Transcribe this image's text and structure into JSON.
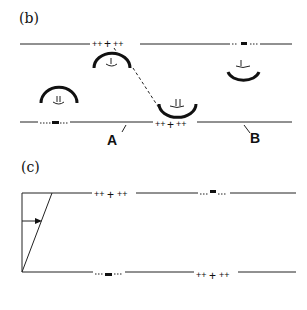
{
  "panel_b": {
    "label": "(b)",
    "top_plus": "++++++",
    "top_minus": "--▬--",
    "bottom_minus": "--▬--",
    "bottom_plus": "+++++",
    "marker_a": "A",
    "marker_b": "B"
  },
  "panel_c": {
    "label": "(c)",
    "top_plus": "++++",
    "top_minus": "--▬--",
    "bottom_minus": "--▬--",
    "bottom_plus": "+++++"
  }
}
